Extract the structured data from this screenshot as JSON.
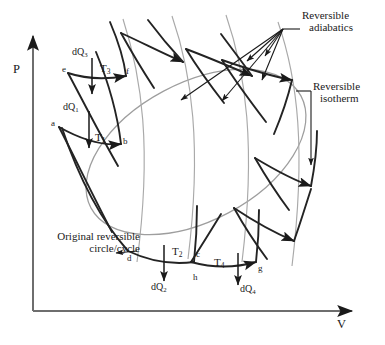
{
  "figure": {
    "kind": "pressure-volume-thermodynamic-cycle-diagram",
    "background_color": "#ffffff",
    "ink_color": "#1a1a1a",
    "guide_color": "#9a9a9a"
  },
  "axes": {
    "y_label": "P",
    "x_label": "V"
  },
  "callouts": {
    "adiabatics": "Reversible\nadiabatics",
    "adiabatics_line1": "Reversible",
    "adiabatics_line2": "adiabatics",
    "isotherm_line1": "Reversible",
    "isotherm_line2": "isotherm",
    "original_line1": "Original reversible",
    "original_line2": "circle/cycle"
  },
  "points": [
    {
      "id": "a",
      "label": "a"
    },
    {
      "id": "b",
      "label": "b"
    },
    {
      "id": "c",
      "label": "c"
    },
    {
      "id": "d",
      "label": "d"
    },
    {
      "id": "e",
      "label": "e"
    },
    {
      "id": "f",
      "label": "f"
    },
    {
      "id": "g",
      "label": "g"
    },
    {
      "id": "h",
      "label": "h"
    }
  ],
  "heat_labels": [
    {
      "id": "dQ1",
      "base": "dQ",
      "sub": "1"
    },
    {
      "id": "dQ2",
      "base": "dQ",
      "sub": "2"
    },
    {
      "id": "dQ3",
      "base": "dQ",
      "sub": "3"
    },
    {
      "id": "dQ4",
      "base": "dQ",
      "sub": "4"
    }
  ],
  "temperature_labels": [
    {
      "id": "T1",
      "base": "T",
      "sub": "1"
    },
    {
      "id": "T2",
      "base": "T",
      "sub": "2"
    },
    {
      "id": "T3",
      "base": "T",
      "sub": "3"
    },
    {
      "id": "T4",
      "base": "T",
      "sub": "4"
    }
  ]
}
